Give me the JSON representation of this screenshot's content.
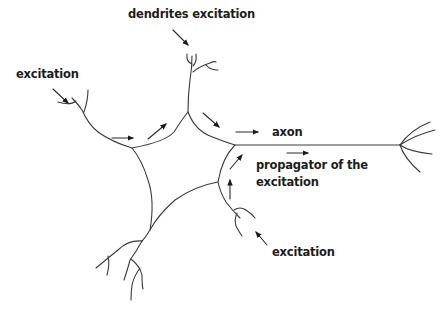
{
  "diagram": {
    "labels": {
      "dendrites_excitation": "dendrites excitation",
      "excitation_left": "excitation",
      "axon": "axon",
      "propagator_line1": "propagator of the",
      "propagator_line2": "excitation",
      "excitation_bottom": "excitation"
    },
    "parts": [
      "cell body",
      "dendrites",
      "axon",
      "axon terminals"
    ],
    "colors": {
      "line": "#3a3a3a",
      "text": "#1c1c1c",
      "background": "#ffffff"
    }
  }
}
